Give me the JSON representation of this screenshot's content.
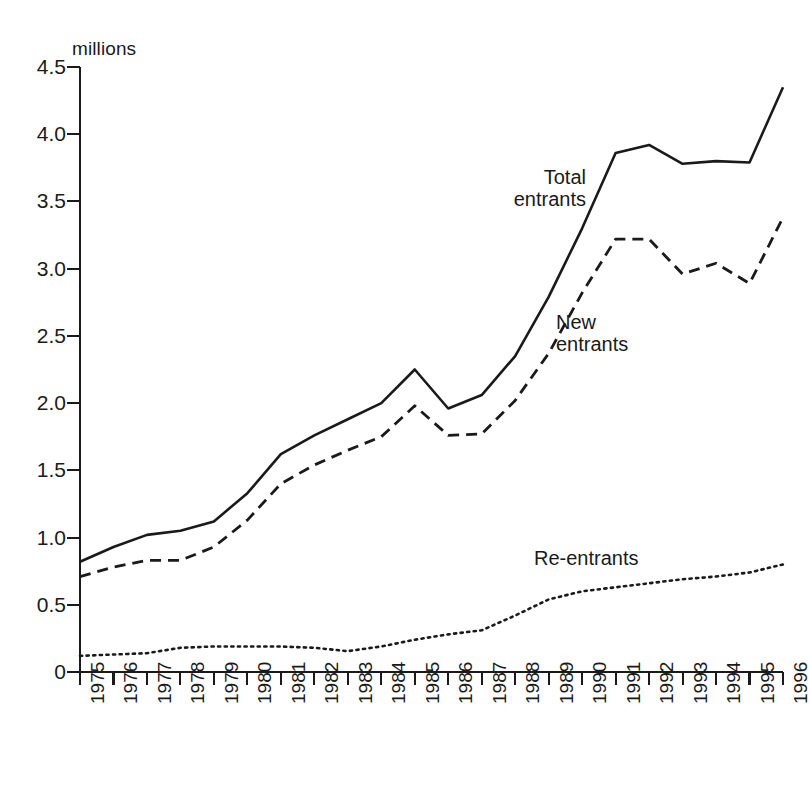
{
  "chart_data": {
    "type": "line",
    "title": "",
    "subtitle": "",
    "xlabel": "",
    "ylabel": "millions",
    "ylim": [
      0,
      4.5
    ],
    "yticks": [
      0,
      0.5,
      1.0,
      1.5,
      2.0,
      2.5,
      3.0,
      3.5,
      4.0,
      4.5
    ],
    "ytick_labels": [
      "0",
      "0.5",
      "1.0",
      "1.5",
      "2.0",
      "2.5",
      "3.0",
      "3.5",
      "4.0",
      "4.5"
    ],
    "grid": false,
    "legend_position": "inline-annotations",
    "x": [
      1975,
      1976,
      1977,
      1978,
      1979,
      1980,
      1981,
      1982,
      1983,
      1984,
      1985,
      1986,
      1987,
      1988,
      1989,
      1990,
      1991,
      1992,
      1993,
      1994,
      1995,
      1996
    ],
    "categories": [
      "1975",
      "1976",
      "1977",
      "1978",
      "1979",
      "1980",
      "1981",
      "1982",
      "1983",
      "1984",
      "1985",
      "1986",
      "1987",
      "1988",
      "1989",
      "1990",
      "1991",
      "1992",
      "1993",
      "1994",
      "1995",
      "1996"
    ],
    "series": [
      {
        "name": "Total entrants",
        "style": "solid",
        "values": [
          0.82,
          0.93,
          1.02,
          1.05,
          1.12,
          1.33,
          1.62,
          1.76,
          1.88,
          2.0,
          2.25,
          1.96,
          2.06,
          2.35,
          2.79,
          3.3,
          3.86,
          3.92,
          3.78,
          3.8,
          3.79,
          4.35
        ]
      },
      {
        "name": "New entrants",
        "style": "dashed",
        "values": [
          0.71,
          0.78,
          0.83,
          0.83,
          0.93,
          1.13,
          1.4,
          1.54,
          1.65,
          1.75,
          1.98,
          1.76,
          1.77,
          2.02,
          2.37,
          2.82,
          3.22,
          3.22,
          2.96,
          3.04,
          2.89,
          3.38
        ]
      },
      {
        "name": "Re-entrants",
        "style": "dotted",
        "values": [
          0.12,
          0.13,
          0.14,
          0.18,
          0.19,
          0.19,
          0.19,
          0.18,
          0.155,
          0.19,
          0.24,
          0.28,
          0.31,
          0.42,
          0.54,
          0.6,
          0.63,
          0.66,
          0.69,
          0.71,
          0.74,
          0.8
        ]
      }
    ],
    "annotations": [
      {
        "text": "Total\nentrants",
        "series": "Total entrants"
      },
      {
        "text": "New\nentrants",
        "series": "New entrants"
      },
      {
        "text": "Re-entrants",
        "series": "Re-entrants"
      }
    ]
  }
}
